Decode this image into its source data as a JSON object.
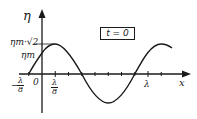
{
  "figure": {
    "type": "wave-snapshot",
    "time_label": "t = 0",
    "y_axis_label": "η",
    "x_axis_label": "x",
    "y_labels": {
      "crest_top": "ηm·√2",
      "amplitude_mark": "ηm"
    },
    "x_labels": {
      "neg_eighth_num": "λ",
      "neg_eighth_prefix": "−",
      "neg_eighth_den": "8",
      "origin": "0",
      "eighth_num": "λ",
      "eighth_den": "8",
      "lambda": "λ"
    },
    "colors": {
      "ink": "#1a1a1a",
      "background": "#ffffff"
    }
  },
  "curve": {
    "description": "sinusoid η = ηm√2 · sin(2π x/λ + π/4) shown at t = 0",
    "zero_crossings_in_lambda": [
      -0.125,
      0.375,
      0.875
    ],
    "crest_at_lambda": 0.125,
    "trough_at_lambda": 0.625,
    "value_at_origin": "ηm",
    "x_range_in_lambda": [
      -0.125,
      1.2
    ]
  }
}
